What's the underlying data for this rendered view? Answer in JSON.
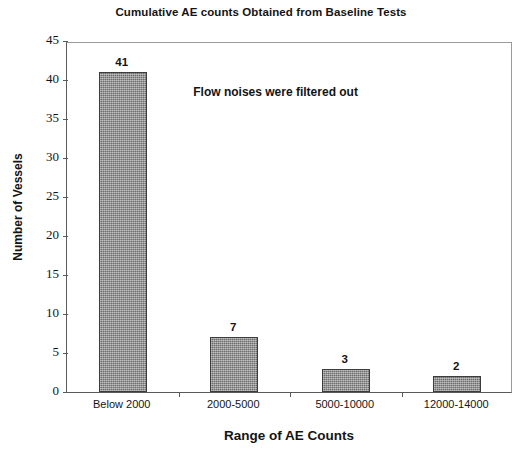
{
  "chart_data": {
    "type": "bar",
    "title": "Cumulative AE counts Obtained from Baseline Tests",
    "xlabel": "Range of AE Counts",
    "ylabel": "Number of Vessels",
    "categories": [
      "Below 2000",
      "2000-5000",
      "5000-10000",
      "12000-14000"
    ],
    "values": [
      41,
      7,
      3,
      2
    ],
    "value_labels": [
      "41",
      "7",
      "3",
      "2"
    ],
    "ylim": [
      0,
      45
    ],
    "yticks": [
      0,
      5,
      10,
      15,
      20,
      25,
      30,
      35,
      40,
      45
    ],
    "ytick_labels": [
      "0",
      "5",
      "10",
      "15",
      "20",
      "25",
      "30",
      "35",
      "40",
      "45"
    ],
    "grid": false,
    "legend": "none",
    "bar_color": "#8a8a8a",
    "bar_border_color": "#3c3c3c",
    "axis_color": "#5a5a5a",
    "background": "#ffffff",
    "annotations": [
      {
        "text": "Flow noises were filtered out",
        "x": 0.47,
        "y": 38.5
      }
    ]
  }
}
